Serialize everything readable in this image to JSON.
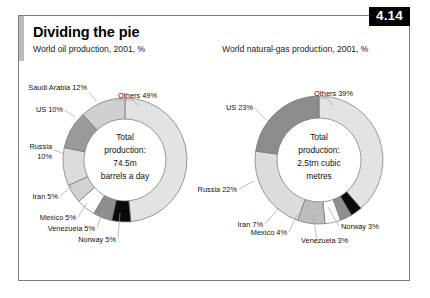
{
  "figure": {
    "number_badge": "4.14",
    "title": "Dividing the pie",
    "source": "Source: BP"
  },
  "charts": [
    {
      "id": "oil",
      "subtitle": "World oil production, 2001, %",
      "center_lines": [
        "Total",
        "production:",
        "74.5m",
        "barrels a day"
      ],
      "labels": {
        "others": "Others 49%",
        "saudi": "Saudi Arabia 12%",
        "us": "US 10%",
        "russia_l1": "Russia",
        "russia_l2": "10%",
        "iran": "Iran 5%",
        "mexico": "Mexico 5%",
        "venezuela": "Venezuela 5%",
        "norway": "Norway 5%"
      }
    },
    {
      "id": "gas",
      "subtitle": "World natural-gas production, 2001, %",
      "center_lines": [
        "Total",
        "production:",
        "2.5trn cubic",
        "metres"
      ],
      "labels": {
        "others": "Others 39%",
        "us": "US 23%",
        "russia": "Russia 22%",
        "iran": "Iran 7%",
        "mexico": "Mexico 4%",
        "venezuela": "Venezuela 3%",
        "norway": "Norway 3%"
      }
    }
  ],
  "chart_data": [
    {
      "type": "pie",
      "id": "oil-donut",
      "title": "World oil production, 2001, %",
      "center_label": "Total production: 74.5m barrels a day",
      "unit": "%",
      "donut": true,
      "start_angle_deg": 0,
      "direction": "clockwise",
      "categories": [
        "Others",
        "Norway",
        "Venezuela",
        "Mexico",
        "Iran",
        "Russia",
        "US",
        "Saudi Arabia"
      ],
      "values": [
        49,
        5,
        5,
        5,
        5,
        10,
        10,
        12
      ],
      "colors": [
        "#e3e3e1",
        "#0a0a0a",
        "#8e8e8c",
        "#ffffff",
        "#d2d2d0",
        "#dcdcda",
        "#9a9a98",
        "#cfcfcd"
      ]
    },
    {
      "type": "pie",
      "id": "gas-donut",
      "title": "World natural-gas production, 2001, %",
      "center_label": "Total production: 2.5trn cubic metres",
      "unit": "%",
      "donut": true,
      "start_angle_deg": 0,
      "direction": "clockwise",
      "categories": [
        "Others",
        "Norway",
        "Venezuela",
        "Mexico",
        "Iran",
        "Russia",
        "US"
      ],
      "values": [
        39,
        3,
        3,
        4,
        7,
        22,
        23
      ],
      "colors": [
        "#e3e3e1",
        "#0a0a0a",
        "#8e8e8c",
        "#ffffff",
        "#bdbdbb",
        "#dcdcda",
        "#8c8c8a"
      ]
    }
  ]
}
